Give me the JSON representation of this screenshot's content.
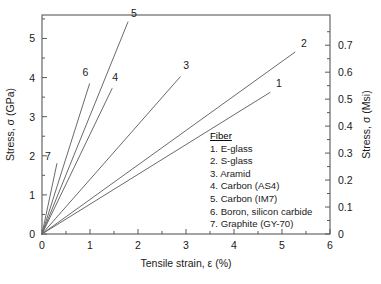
{
  "chart_data": {
    "type": "line",
    "title": "",
    "xlabel": "Tensile strain, ε (%)",
    "ylabel": "Stress, σ (GPa)",
    "y2label": "Stress, σ (Msi)",
    "xlim": [
      0,
      6
    ],
    "ylim": [
      0,
      5.6
    ],
    "y2lim": [
      0,
      0.812
    ],
    "xticks": [
      0,
      1,
      2,
      3,
      4,
      5,
      6
    ],
    "xticklabels": [
      "0",
      "1",
      "2",
      "3",
      "4",
      "5",
      "6"
    ],
    "yticks": [
      0,
      1,
      2,
      3,
      4,
      5
    ],
    "yticklabels": [
      "0",
      "1",
      "2",
      "3",
      "4",
      "5"
    ],
    "y2ticks": [
      0,
      0.1,
      0.2,
      0.3,
      0.4,
      0.5,
      0.6,
      0.7
    ],
    "y2ticklabels": [
      "0",
      "0.1",
      "0.2",
      "0.3",
      "0.4",
      "0.5",
      "0.6",
      "0.7"
    ],
    "grid": false,
    "legend_position": "inside-lower-right",
    "note": "All curves are straight lines from the origin (0,0) to their failure point.",
    "series": [
      {
        "id": "1",
        "name": "E-glass",
        "x": [
          0,
          4.75
        ],
        "y": [
          0,
          3.62
        ],
        "label": "1"
      },
      {
        "id": "2",
        "name": "S-glass",
        "x": [
          0,
          5.27
        ],
        "y": [
          0,
          4.65
        ],
        "label": "2"
      },
      {
        "id": "3",
        "name": "Aramid",
        "x": [
          0,
          2.88
        ],
        "y": [
          0,
          4.02
        ],
        "label": "3"
      },
      {
        "id": "4",
        "name": "Carbon (AS4)",
        "x": [
          0,
          1.46
        ],
        "y": [
          0,
          3.72
        ],
        "label": "4"
      },
      {
        "id": "5",
        "name": "Carbon (IM7)",
        "x": [
          0,
          1.79
        ],
        "y": [
          0,
          5.42
        ],
        "label": "5"
      },
      {
        "id": "6",
        "name": "Boron, silicon carbide",
        "x": [
          0,
          0.99
        ],
        "y": [
          0,
          3.84
        ],
        "label": "6"
      },
      {
        "id": "7",
        "name": "Graphite (GY-70)",
        "x": [
          0,
          0.31
        ],
        "y": [
          0,
          1.8
        ],
        "label": "7"
      }
    ]
  },
  "legend": {
    "title": "Fiber",
    "entries": [
      "1. E-glass",
      "2. S-glass",
      "3. Aramid",
      "4. Carbon (AS4)",
      "5. Carbon (IM7)",
      "6. Boron, silicon carbide",
      "7. Graphite (GY-70)"
    ]
  },
  "axes": {
    "x_title": "Tensile strain, ε (%)",
    "y_left_title": "Stress, σ (GPa)",
    "y_right_title": "Stress, σ (Msi)"
  },
  "colors": {
    "curve": "#6a6a6a",
    "frame": "#5a5a5a",
    "text": "#1a1a1a",
    "background": "#ffffff"
  }
}
